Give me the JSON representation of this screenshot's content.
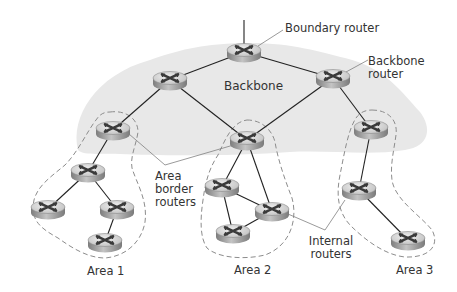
{
  "diagram": {
    "backbone_label": "Backbone",
    "colors": {
      "backbone_fill": "#e9e9e9",
      "area_boundary": "#8a8a8a",
      "link": "#222222",
      "callout": "#777777",
      "router_top": "#d8d8d8",
      "router_side": "#9a9a9a",
      "router_x": "#333333",
      "text": "#333333"
    },
    "labels": {
      "boundary_router": "Boundary router",
      "backbone_router_line1": "Backbone",
      "backbone_router_line2": "router",
      "area_border_line1": "Area",
      "area_border_line2": "border",
      "area_border_line3": "routers",
      "internal_line1": "Internal",
      "internal_line2": "routers",
      "area1": "Area 1",
      "area2": "Area 2",
      "area3": "Area 3"
    },
    "routers": [
      {
        "id": "boundary",
        "role": "boundary-router",
        "x": 244,
        "y": 50
      },
      {
        "id": "bb-left",
        "role": "backbone-router",
        "x": 170,
        "y": 78
      },
      {
        "id": "bb-right",
        "role": "backbone-router",
        "x": 333,
        "y": 76
      },
      {
        "id": "a1-border",
        "role": "area-border-router",
        "area": "Area 1",
        "x": 113,
        "y": 128
      },
      {
        "id": "a2-border",
        "role": "area-border-router",
        "area": "Area 2",
        "x": 247,
        "y": 138
      },
      {
        "id": "a3-border",
        "role": "area-border-router",
        "area": "Area 3",
        "x": 371,
        "y": 127
      },
      {
        "id": "a1-r1",
        "role": "internal-router",
        "area": "Area 1",
        "x": 88,
        "y": 170
      },
      {
        "id": "a1-r2",
        "role": "internal-router",
        "area": "Area 1",
        "x": 48,
        "y": 207
      },
      {
        "id": "a1-r3",
        "role": "internal-router",
        "area": "Area 1",
        "x": 117,
        "y": 207
      },
      {
        "id": "a1-r4",
        "role": "internal-router",
        "area": "Area 1",
        "x": 105,
        "y": 240
      },
      {
        "id": "a2-r1",
        "role": "internal-router",
        "area": "Area 2",
        "x": 222,
        "y": 185
      },
      {
        "id": "a2-r2",
        "role": "internal-router",
        "area": "Area 2",
        "x": 272,
        "y": 209
      },
      {
        "id": "a2-r3",
        "role": "internal-router",
        "area": "Area 2",
        "x": 233,
        "y": 231
      },
      {
        "id": "a3-r1",
        "role": "internal-router",
        "area": "Area 3",
        "x": 359,
        "y": 188
      },
      {
        "id": "a3-r2",
        "role": "internal-router",
        "area": "Area 3",
        "x": 408,
        "y": 238
      }
    ],
    "links": [
      [
        "boundary",
        "bb-left"
      ],
      [
        "boundary",
        "bb-right"
      ],
      [
        "bb-left",
        "a1-border"
      ],
      [
        "bb-left",
        "a2-border"
      ],
      [
        "bb-right",
        "a2-border"
      ],
      [
        "bb-right",
        "a3-border"
      ],
      [
        "a1-border",
        "a1-r1"
      ],
      [
        "a1-r1",
        "a1-r2"
      ],
      [
        "a1-r1",
        "a1-r3"
      ],
      [
        "a1-r3",
        "a1-r4"
      ],
      [
        "a2-border",
        "a2-r1"
      ],
      [
        "a2-border",
        "a2-r2"
      ],
      [
        "a2-r1",
        "a2-r2"
      ],
      [
        "a2-r1",
        "a2-r3"
      ],
      [
        "a2-r2",
        "a2-r3"
      ],
      [
        "a3-border",
        "a3-r1"
      ],
      [
        "a3-r1",
        "a3-r2"
      ]
    ]
  }
}
